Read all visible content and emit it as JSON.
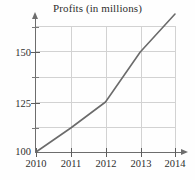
{
  "chart_data": {
    "type": "line",
    "title": "Profits (in millions)",
    "xlabel": "",
    "ylabel": "",
    "x": [
      "2010",
      "2011",
      "2012",
      "2013",
      "2014"
    ],
    "categories": [
      "2010",
      "2011",
      "2012",
      "2013",
      "2014"
    ],
    "values": [
      100,
      112,
      125,
      150,
      169
    ],
    "series": [
      {
        "name": "Profits",
        "values": [
          100,
          112,
          125,
          150,
          169
        ]
      }
    ],
    "xlim": [
      2010,
      2014
    ],
    "ylim": [
      100,
      175
    ],
    "y_ticks_labeled": [
      100,
      125,
      150
    ],
    "y_ticks_unlabeled": [
      112.5,
      137.5,
      162.5
    ],
    "y_tick_labels": [
      "100",
      "125",
      "150"
    ],
    "x_tick_labels": [
      "2010",
      "2011",
      "2012",
      "2013",
      "2014"
    ],
    "grid": true,
    "legend": false,
    "line_color": "#6b6b6b",
    "grid_color": "#d2d2d2",
    "axis_color": "#6d6d6d"
  },
  "axes": {
    "y_labels": [
      {
        "text": "150",
        "value": 150
      },
      {
        "text": "125",
        "value": 125
      },
      {
        "text": "100",
        "value": 100
      }
    ],
    "x_labels": [
      {
        "text": "2010",
        "value": 2010
      },
      {
        "text": "2011",
        "value": 2011
      },
      {
        "text": "2012",
        "value": 2012
      },
      {
        "text": "2013",
        "value": 2013
      },
      {
        "text": "2014",
        "value": 2014
      }
    ]
  }
}
